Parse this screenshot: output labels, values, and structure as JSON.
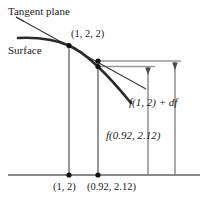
{
  "figure": {
    "labels": {
      "tangent_plane": "Tangent plane",
      "surface": "Surface",
      "point_of_tangency": "(1, 2, 2)",
      "value_tangent": "f(1, 2) + df",
      "value_surface": "f(0.92, 2.12)",
      "base_point": "(1, 2)",
      "base_point_shifted": "(0.92, 2.12)"
    },
    "colors": {
      "curve": "#2b2b2b",
      "tangent_line": "#3a3a3a",
      "axis": "#8a8a8a",
      "drop_line": "#6e6e6e",
      "measure_line": "#9a9a9a",
      "text": "#1a1a1a",
      "point": "#111111",
      "background": "#ffffff"
    },
    "geometry": {
      "baseline_y": 175,
      "baseline_x_start": 8,
      "baseline_x_end": 200,
      "tangency_x": 69,
      "tangency_y": 45,
      "shift_x": 98,
      "tangent_value_y": 61,
      "surface_value_y": 66,
      "measure_outer_x": 175,
      "measure_inner_x": 148,
      "horizontal_upper_end_x": 181,
      "horizontal_lower_end_x": 155,
      "curve_start_x": 18,
      "curve_start_y": 38,
      "curve_end_x": 131,
      "curve_end_y": 103,
      "tangent_start_x": 16,
      "tangent_start_y": 17,
      "tangent_end_x": 146,
      "tangent_end_y": 89
    },
    "points": [
      {
        "name": "tangency-point",
        "x": 69,
        "y": 45
      },
      {
        "name": "tangent-plane-value-point",
        "x": 98,
        "y": 61
      },
      {
        "name": "surface-value-point",
        "x": 98,
        "y": 66
      },
      {
        "name": "base-point-dot",
        "x": 69,
        "y": 175
      },
      {
        "name": "base-point-shifted-dot",
        "x": 98,
        "y": 175
      }
    ]
  }
}
